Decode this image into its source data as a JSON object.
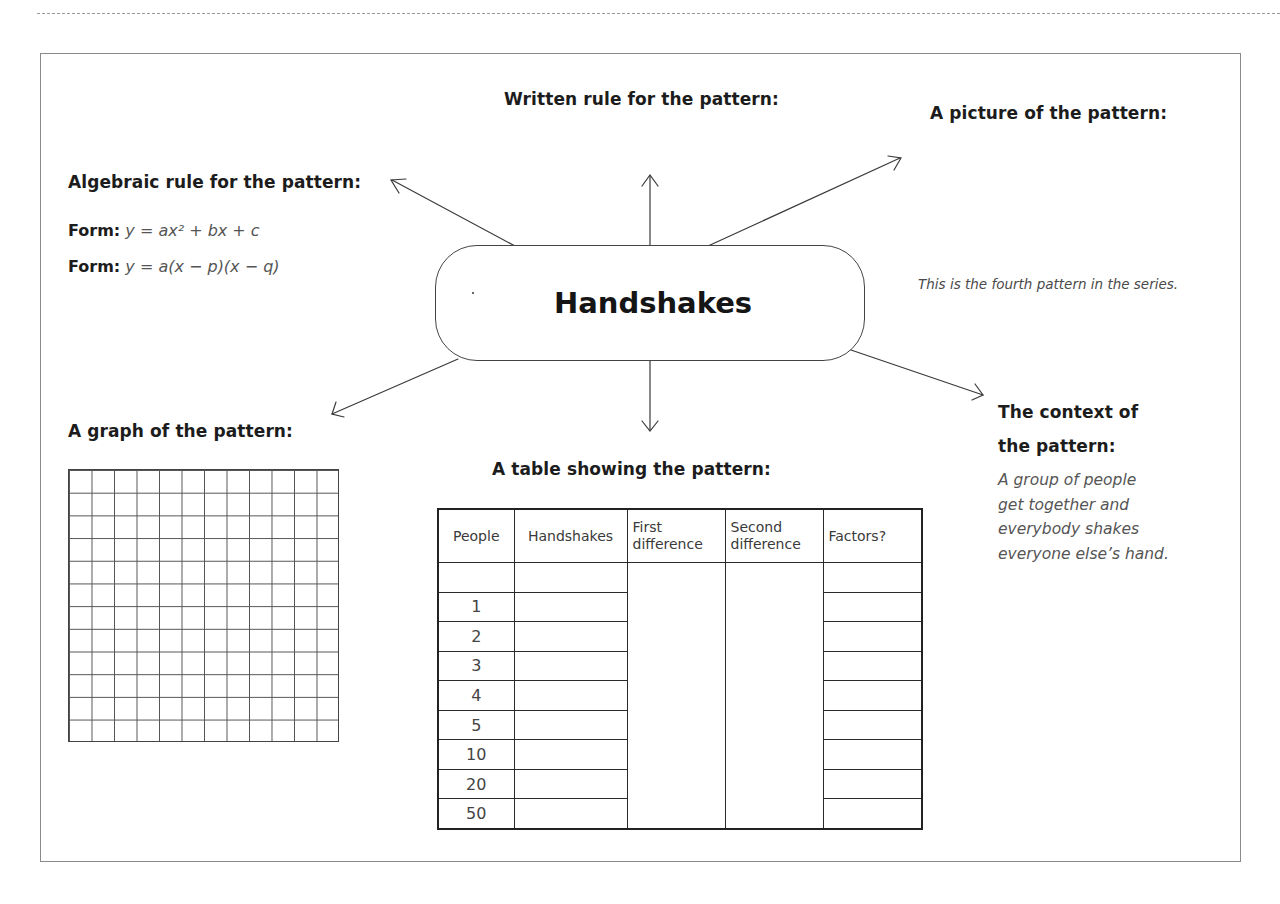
{
  "worksheet": {
    "central_topic": "Handshakes",
    "sections": {
      "written_rule": {
        "heading": "Written rule for the pattern:"
      },
      "picture": {
        "heading": "A picture of the pattern:",
        "note": "This is the fourth pattern in the series."
      },
      "algebraic_rule": {
        "heading": "Algebraic rule for the pattern:",
        "forms": [
          {
            "label": "Form:",
            "expression": "y = ax² + bx + c"
          },
          {
            "label": "Form:",
            "expression": "y = a(x − p)(x − q)"
          }
        ]
      },
      "graph": {
        "heading": "A graph of the pattern:",
        "grid_columns": 12,
        "grid_rows": 12
      },
      "table": {
        "heading": "A table showing the pattern:",
        "columns": [
          "People",
          "Handshakes",
          "First difference",
          "Second difference",
          "Factors?"
        ],
        "column_lines": [
          [
            "People"
          ],
          [
            "Handshakes"
          ],
          [
            "First",
            "difference"
          ],
          [
            "Second",
            "difference"
          ],
          [
            "Factors?"
          ]
        ],
        "people_values": [
          "",
          "1",
          "2",
          "3",
          "4",
          "5",
          "10",
          "20",
          "50"
        ]
      },
      "context": {
        "heading_line1": "The context of",
        "heading_line2": "the pattern:",
        "description_lines": [
          "A group of people",
          "get together and",
          "everybody shakes",
          "everyone else’s hand."
        ]
      }
    }
  }
}
